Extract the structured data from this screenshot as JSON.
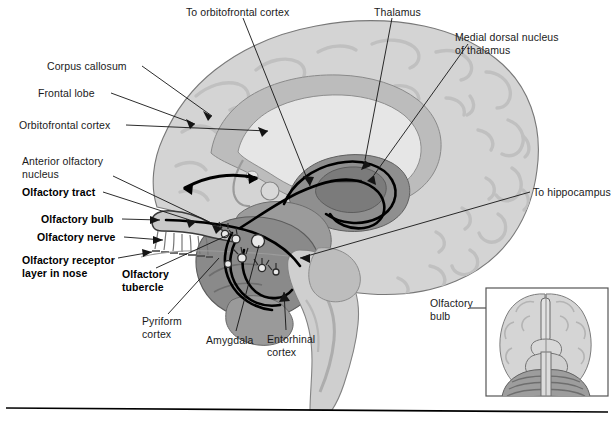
{
  "figure": {
    "background_color": "#ffffff",
    "rule_color": "#000000"
  },
  "palette": {
    "cortex_light": "#d2d2d2",
    "cortex_mid": "#bdbdbd",
    "white_matter": "#cfcfcf",
    "ventricle": "#e8e8e8",
    "limbic_dark": "#8e8e8e",
    "thalamus_dark": "#7d7d7d",
    "brainstem": "#cdcdcd",
    "outline": "#6f6f6f",
    "tract_black": "#000000",
    "leader_line": "#1a1a1a",
    "inset_border": "#555555",
    "cerebellum": "#9a9a9a"
  },
  "labels": [
    {
      "id": "to-orbitofrontal-cortex",
      "text": "To orbitofrontal cortex",
      "bold": false,
      "x": 186,
      "y": 6,
      "align": "left"
    },
    {
      "id": "thalamus",
      "text": "Thalamus",
      "bold": false,
      "x": 374,
      "y": 6,
      "align": "left"
    },
    {
      "id": "medial-dorsal-nucleus-of-thalamus",
      "text": "Medial dorsal nucleus\nof thalamus",
      "bold": false,
      "x": 455,
      "y": 31,
      "align": "left"
    },
    {
      "id": "corpus-callosum",
      "text": "Corpus callosum",
      "bold": false,
      "x": 47,
      "y": 66,
      "align": "left"
    },
    {
      "id": "frontal-lobe",
      "text": "Frontal lobe",
      "bold": false,
      "x": 38,
      "y": 92,
      "align": "left"
    },
    {
      "id": "orbitofrontal-cortex",
      "text": "Orbitofrontal cortex",
      "bold": false,
      "x": 19,
      "y": 121,
      "align": "left"
    },
    {
      "id": "anterior-olfactory-nucleus",
      "text": "Anterior olfactory\nnucleus",
      "bold": false,
      "x": 22,
      "y": 157,
      "align": "left"
    },
    {
      "id": "olfactory-tract",
      "text": "Olfactory tract",
      "bold": true,
      "x": 22,
      "y": 190,
      "align": "left"
    },
    {
      "id": "olfactory-bulb",
      "text": "Olfactory bulb",
      "bold": true,
      "x": 41,
      "y": 216,
      "align": "left"
    },
    {
      "id": "olfactory-nerve",
      "text": "Olfactory nerve",
      "bold": true,
      "x": 37,
      "y": 234,
      "align": "left"
    },
    {
      "id": "olfactory-receptor-layer-in-nose",
      "text": "Olfactory receptor\nlayer in nose",
      "bold": true,
      "x": 22,
      "y": 257,
      "align": "left"
    },
    {
      "id": "olfactory-tubercle",
      "text": "Olfactory\ntubercle",
      "bold": true,
      "x": 122,
      "y": 271,
      "align": "left"
    },
    {
      "id": "to-hippocampus",
      "text": "To hippocampus",
      "bold": false,
      "x": 533,
      "y": 188,
      "align": "left"
    },
    {
      "id": "pyriform-cortex",
      "text": "Pyriform\ncortex",
      "bold": false,
      "x": 142,
      "y": 318,
      "align": "left"
    },
    {
      "id": "amygdala",
      "text": "Amygdala",
      "bold": false,
      "x": 206,
      "y": 337,
      "align": "left"
    },
    {
      "id": "entorhinal-cortex",
      "text": "Entorhinal\ncortex",
      "bold": false,
      "x": 267,
      "y": 336,
      "align": "left"
    },
    {
      "id": "inset-olfactory-bulb",
      "text": "Olfactory\nbulb",
      "bold": false,
      "x": 430,
      "y": 300,
      "align": "left"
    }
  ],
  "inset": {
    "name": "ventral-brain-inset",
    "x": 485,
    "y": 287,
    "width": 124,
    "height": 110,
    "caption": "Olfactory bulb (ventral view)"
  },
  "structures": [
    {
      "name": "cerebral-cortex",
      "tone": "cortex_light"
    },
    {
      "name": "corpus-callosum-body",
      "tone": "cortex_mid"
    },
    {
      "name": "lateral-ventricle",
      "tone": "ventricle"
    },
    {
      "name": "thalamus",
      "tone": "limbic_dark"
    },
    {
      "name": "medial-dorsal-nucleus",
      "tone": "thalamus_dark"
    },
    {
      "name": "amygdala-pyriform-complex",
      "tone": "limbic_dark"
    },
    {
      "name": "brainstem",
      "tone": "brainstem"
    },
    {
      "name": "olfactory-bulb",
      "tone": "cortex_mid"
    },
    {
      "name": "olfactory-nerve-fibers",
      "tone": "outline"
    }
  ],
  "pathways": [
    {
      "name": "olfactory-tract-to-orbitofrontal",
      "from": "olfactory-bulb",
      "to": "orbitofrontal cortex"
    },
    {
      "name": "olfactory-tract-to-thalamus",
      "from": "olfactory-bulb",
      "to": "medial dorsal nucleus of thalamus"
    },
    {
      "name": "olfactory-tract-to-amygdala",
      "from": "olfactory-bulb",
      "to": "amygdala"
    },
    {
      "name": "entorhinal-to-hippocampus",
      "from": "entorhinal cortex",
      "to": "hippocampus"
    }
  ]
}
